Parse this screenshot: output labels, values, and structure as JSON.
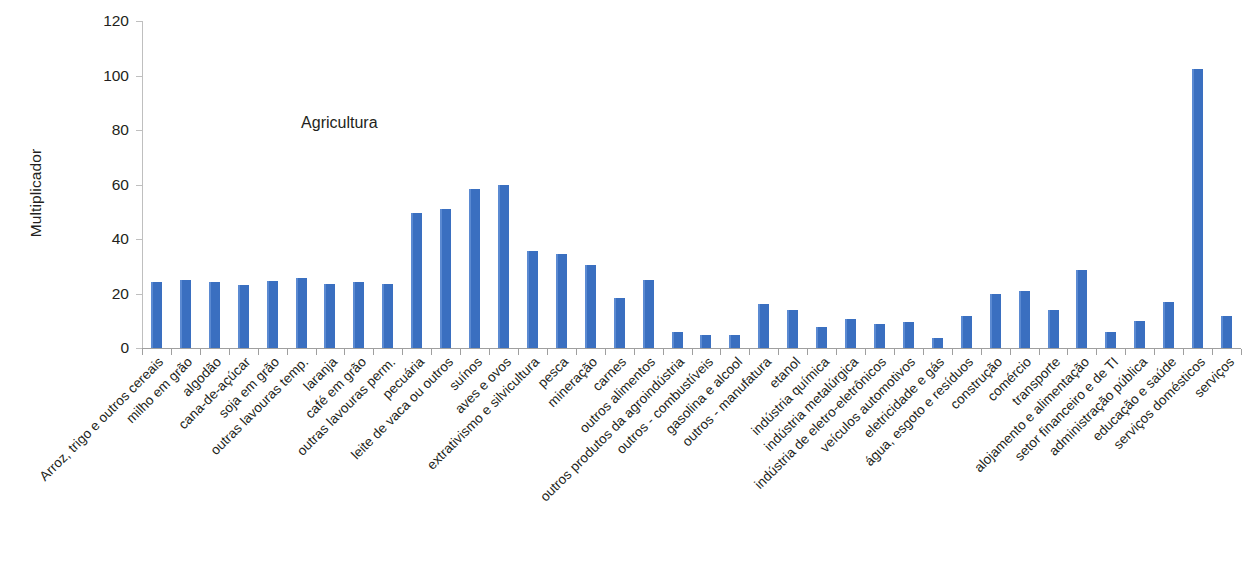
{
  "chart_data": {
    "type": "bar",
    "title": "",
    "subtitle": "",
    "xlabel": "",
    "ylabel": "Multiplicador",
    "ylim": [
      0,
      120
    ],
    "ytick_labels": [
      "0",
      "20",
      "40",
      "60",
      "80",
      "100",
      "120"
    ],
    "yticks": [
      0,
      20,
      40,
      60,
      80,
      100,
      120
    ],
    "grid": false,
    "legend": null,
    "bar_color": "#4176c4",
    "annotations": [
      {
        "text": "Agricultura",
        "x_category": "outras lavouras temp.",
        "y_value": 86
      }
    ],
    "categories": [
      "Arroz, trigo e outros cereais",
      "milho em grão",
      "algodão",
      "cana-de-açúcar",
      "soja em grão",
      "outras lavouras temp.",
      "laranja",
      "café em grão",
      "outras lavouras perm.",
      "pecuária",
      "leite de vaca ou outros",
      "suínos",
      "aves e ovos",
      "extrativismo e silvicultura",
      "pesca",
      "mineração",
      "carnes",
      "outros alimentos",
      "outros produtos da agroindústria",
      "outros - combustíveis",
      "gasolina e alcool",
      "outros - manufatura",
      "etanol",
      "indústria química",
      "indústria metalúrgica",
      "indústria de eletro-eletrônicos",
      "veículos automotivos",
      "eletricidade e gás",
      "água, esgoto e resíduos",
      "construção",
      "comércio",
      "transporte",
      "alojamento e alimentação",
      "setor financeiro e de TI",
      "administração pública",
      "educação e saúde",
      "serviços domésticos",
      "serviços"
    ],
    "values": [
      24.2,
      25.0,
      24.1,
      23.2,
      24.5,
      25.6,
      23.6,
      24.1,
      23.6,
      49.6,
      51.0,
      58.3,
      59.8,
      35.6,
      34.4,
      30.5,
      18.2,
      24.8,
      5.8,
      4.9,
      4.6,
      16.2,
      13.9,
      7.7,
      10.6,
      8.8,
      9.6,
      3.8,
      11.9,
      19.8,
      20.8,
      13.9,
      28.8,
      6.0,
      9.8,
      17.0,
      102.3,
      11.9
    ]
  }
}
